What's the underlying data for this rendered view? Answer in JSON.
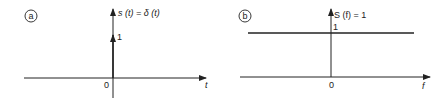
{
  "panels": [
    {
      "id": "a",
      "badge": "a",
      "function_label": "s (t) = δ (t)",
      "impulse_height_label": "1",
      "origin_label": "0",
      "x_axis_label": "t"
    },
    {
      "id": "b",
      "badge": "b",
      "function_label": "S (f) = 1",
      "level_label": "1",
      "origin_label": "0",
      "x_axis_label": "f"
    }
  ],
  "colors": {
    "ink": "#222222",
    "background": "#ffffff"
  }
}
